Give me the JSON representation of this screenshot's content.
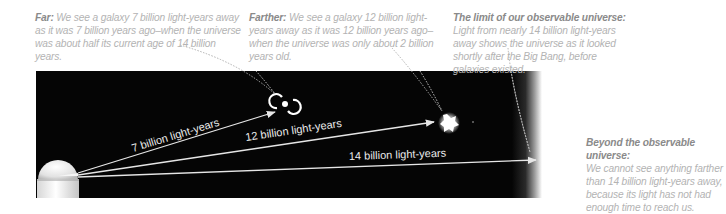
{
  "captions": {
    "far": {
      "title": "Far:",
      "text": " We see a galaxy 7 billion light-years away as it was 7 billion years ago–when the universe was about half its current age of 14 billion years."
    },
    "farther": {
      "title": "Farther:",
      "text": " We see a galaxy 12 billion light-years away as it was 12 billion years ago–when the universe was only about 2 billion years old."
    },
    "limit": {
      "title": "The limit of our observable universe:",
      "text": "Light from nearly 14 billion light-years away shows the universe as it looked shortly after the Big Bang, before galaxies existed."
    },
    "beyond": {
      "title": "Beyond the observable universe:",
      "text": "We cannot see anything farther than 14 billion light-years away, because its light has not had enough time to reach us."
    }
  },
  "rays": {
    "ray_7": "7 billion light-years",
    "ray_12": "12 billion light-years",
    "ray_14": "14 billion light-years"
  },
  "icons": {
    "observer": "observatory-dome-icon",
    "galaxy_7": "spiral-galaxy-icon",
    "galaxy_12": "young-galaxy-blob-icon"
  },
  "colors": {
    "space": "#050505",
    "ray": "#e6e6e6",
    "caption_title": "#8a8a8a",
    "caption_text": "#b3b3b3"
  }
}
